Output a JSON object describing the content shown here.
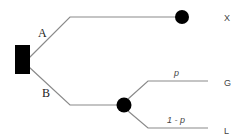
{
  "diagram": {
    "type": "decision-tree",
    "decision_node": {
      "shape": "square",
      "color": "#000000"
    },
    "branches": [
      {
        "label": "A",
        "outcome": "X"
      },
      {
        "label": "B",
        "chance_node": true,
        "sub_branches": [
          {
            "probability": "p",
            "outcome": "G"
          },
          {
            "probability": "1 - p",
            "outcome": "L"
          }
        ]
      }
    ],
    "colors": {
      "lines": "#8a8a8a",
      "nodes": "#000000",
      "text": "#222222"
    }
  }
}
